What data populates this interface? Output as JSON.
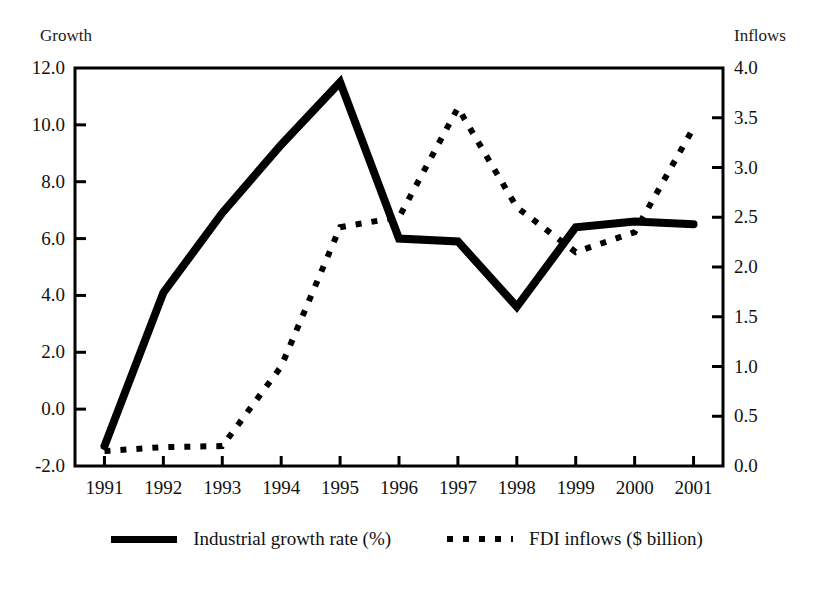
{
  "chart_data": {
    "type": "line",
    "title": "",
    "xlabel": "",
    "categories": [
      "1991",
      "1992",
      "1993",
      "1994",
      "1995",
      "1996",
      "1997",
      "1998",
      "1999",
      "2000",
      "2001"
    ],
    "grid": false,
    "legend_position": "bottom-center",
    "axes": {
      "left": {
        "label": "Growth",
        "ylim": [
          -2.0,
          12.0
        ],
        "tick_step": 2.0,
        "ticks": [
          "12.0",
          "10.0",
          "8.0",
          "6.0",
          "4.0",
          "2.0",
          "0.0",
          "-2.0"
        ],
        "tick_values": [
          12.0,
          10.0,
          8.0,
          6.0,
          4.0,
          2.0,
          0.0,
          -2.0
        ]
      },
      "right": {
        "label": "Inflows",
        "ylim": [
          0.0,
          4.0
        ],
        "tick_step": 0.5,
        "ticks": [
          "4.0",
          "3.5",
          "3.0",
          "2.5",
          "2.0",
          "1.5",
          "1.0",
          "0.5",
          "0.0"
        ],
        "tick_values": [
          4.0,
          3.5,
          3.0,
          2.5,
          2.0,
          1.5,
          1.0,
          0.5,
          0.0
        ]
      }
    },
    "series": [
      {
        "name": "Industrial growth rate (%)",
        "axis": "left",
        "style": "solid",
        "color": "#000000",
        "values": [
          -1.3,
          4.1,
          6.9,
          9.3,
          11.5,
          6.0,
          5.9,
          3.6,
          6.4,
          6.6,
          6.5
        ]
      },
      {
        "name": "FDI inflows ($ billion)",
        "axis": "right",
        "style": "dotted",
        "color": "#000000",
        "values": [
          0.15,
          0.19,
          0.2,
          1.0,
          2.4,
          2.5,
          3.6,
          2.6,
          2.15,
          2.35,
          3.4
        ]
      }
    ]
  },
  "legend": {
    "items": [
      {
        "label": "Industrial growth rate (%)",
        "style": "solid"
      },
      {
        "label": "FDI inflows ($ billion)",
        "style": "dotted"
      }
    ]
  }
}
